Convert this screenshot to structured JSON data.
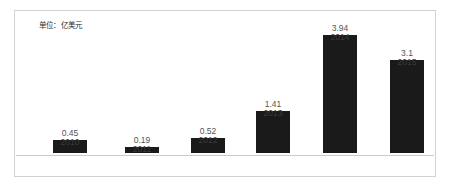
{
  "caption": {
    "unit_text": "单位：亿美元"
  },
  "colors": {
    "bar": "#1a1a1a",
    "frame": "#d2d2d2",
    "axis": "#c9c9c9",
    "value_label": "#555555",
    "category_label": "#3a3a3a",
    "background": "#ffffff"
  },
  "chart_data": {
    "type": "bar",
    "title": "",
    "subtitle": "",
    "xlabel": "",
    "ylabel": "",
    "unit": "亿美元",
    "annotations": [
      "单位：亿美元"
    ],
    "categories": [
      "2010",
      "2011",
      "2012",
      "2013",
      "2014",
      "2015"
    ],
    "values": [
      0.45,
      0.19,
      0.52,
      1.41,
      3.94,
      3.1
    ],
    "value_labels": [
      "0.45",
      "0.19",
      "0.52",
      "1.41",
      "3.94",
      "3.1"
    ],
    "ylim": [
      0,
      3.94
    ],
    "grid": false,
    "legend": null,
    "legend_position": "none",
    "bars": [
      {
        "category": "2010",
        "value": 0.45,
        "label": "0.45",
        "height_px": 13,
        "center_x": 55
      },
      {
        "category": "2011",
        "value": 0.19,
        "label": "0.19",
        "height_px": 6,
        "center_x": 127
      },
      {
        "category": "2012",
        "value": 0.52,
        "label": "0.52",
        "height_px": 15,
        "center_x": 193
      },
      {
        "category": "2013",
        "value": 1.41,
        "label": "1.41",
        "height_px": 42,
        "center_x": 258
      },
      {
        "category": "2014",
        "value": 3.94,
        "label": "3.94",
        "height_px": 118,
        "center_x": 325
      },
      {
        "category": "2015",
        "value": 3.1,
        "label": "3.1",
        "height_px": 93,
        "center_x": 392
      }
    ]
  }
}
